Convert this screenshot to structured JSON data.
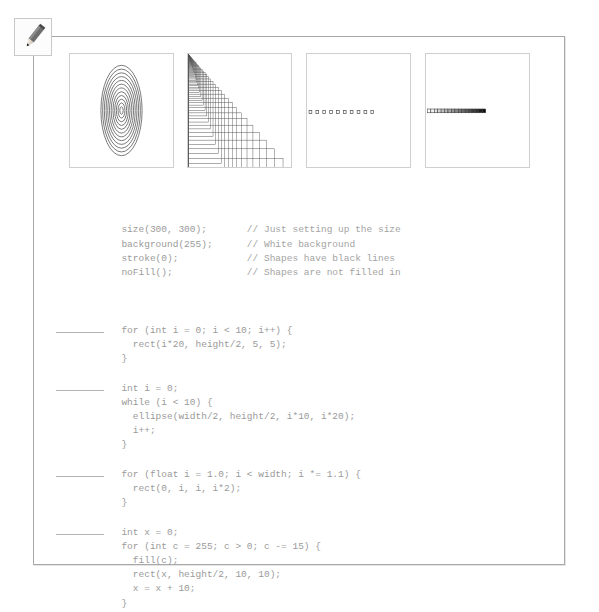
{
  "page": {
    "pencil_icon": "pencil-icon"
  },
  "figures": [
    {
      "id": "A",
      "label": "A",
      "description": "concentric-ellipses",
      "render": "ellipses"
    },
    {
      "id": "B",
      "label": "B",
      "description": "nested-growing-rectangles-triangle",
      "render": "rects-exponential"
    },
    {
      "id": "C",
      "label": "C",
      "description": "row-of-ten-small-squares",
      "render": "squares-row",
      "count": 10
    },
    {
      "id": "D",
      "label": "D",
      "description": "gradient-filled-squares-bar",
      "render": "gradient-row",
      "count": 17
    }
  ],
  "code": {
    "preamble": [
      {
        "code": "size(300, 300);",
        "comment": "// Just setting up the size"
      },
      {
        "code": "background(255);",
        "comment": "// White background"
      },
      {
        "code": "stroke(0);",
        "comment": "// Shapes have black lines"
      },
      {
        "code": "noFill();",
        "comment": "// Shapes are not filled in"
      }
    ],
    "blocks": [
      {
        "answer_blank": true,
        "lines": [
          "for (int i = 0; i < 10; i++) {",
          "  rect(i*20, height/2, 5, 5);",
          "}"
        ]
      },
      {
        "answer_blank": true,
        "lines": [
          "int i = 0;",
          "while (i < 10) {",
          "  ellipse(width/2, height/2, i*10, i*20);",
          "  i++;",
          "}"
        ]
      },
      {
        "answer_blank": true,
        "lines": [
          "for (float i = 1.0; i < width; i *= 1.1) {",
          "  rect(0, i, i, i*2);",
          "}"
        ]
      },
      {
        "answer_blank": true,
        "lines": [
          "int x = 0;",
          "for (int c = 255; c > 0; c -= 15) {",
          "  fill(c);",
          "  rect(x, height/2, 10, 10);",
          "  x = x + 10;",
          "}"
        ]
      }
    ]
  },
  "colors": {
    "page_border": "#a8a8a8",
    "panel_border": "#cfcfcf",
    "code_text": "#9a9a9a",
    "label_text": "#3a3a3a",
    "ink": "#555555"
  }
}
